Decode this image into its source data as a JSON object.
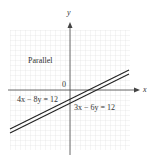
{
  "graph": {
    "axis_x_label": "x",
    "axis_y_label": "y",
    "origin_label": "0",
    "region_label": "Parallel",
    "line1_label": "4x − 8y = 12",
    "line2_label": "3x − 6y = 12",
    "grid_color": "#dcdcdc",
    "line_color": "#222222"
  }
}
